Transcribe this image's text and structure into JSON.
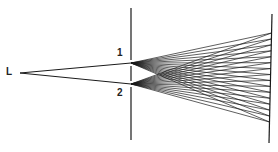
{
  "diagram": {
    "labels": {
      "source": "L",
      "slit1": "1",
      "slit2": "2"
    },
    "colors": {
      "ink": "#1a1a1a",
      "background": "#ffffff"
    },
    "geometry": {
      "source": [
        20,
        73
      ],
      "barrier_x": 131,
      "barrier_y": [
        8,
        140
      ],
      "slit1": [
        131,
        63
      ],
      "slit2": [
        131,
        84
      ],
      "screen_top": [
        272,
        14
      ],
      "screen_bottom": [
        269,
        143
      ],
      "ray_end_y_range": [
        33,
        122
      ],
      "rays_per_slit": 16
    }
  }
}
